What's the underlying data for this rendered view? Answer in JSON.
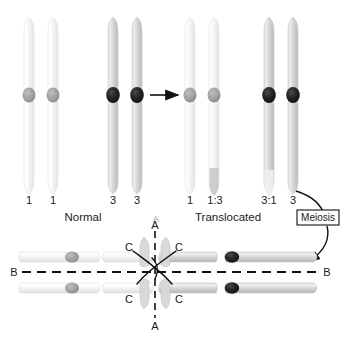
{
  "figure": {
    "panel_label": "A",
    "background_color": "#ffffff"
  },
  "top_row": {
    "groups": [
      {
        "name": "normal-pair-1",
        "group_label": "Normal",
        "chromosomes": [
          {
            "id": "chr-1-left",
            "number_label": "1",
            "body_color": "#f0f0f0",
            "centromere_color": "#9a9a9a",
            "tip_color": null
          },
          {
            "id": "chr-1-right",
            "number_label": "1",
            "body_color": "#f0f0f0",
            "centromere_color": "#9a9a9a",
            "tip_color": null
          }
        ]
      },
      {
        "name": "normal-pair-3",
        "group_label": "",
        "chromosomes": [
          {
            "id": "chr-3-left",
            "number_label": "3",
            "body_color": "#d2d2d2",
            "centromere_color": "#242424",
            "tip_color": null
          },
          {
            "id": "chr-3-right",
            "number_label": "3",
            "body_color": "#d2d2d2",
            "centromere_color": "#242424",
            "tip_color": null
          }
        ]
      },
      {
        "name": "translocated-pair-1",
        "group_label": "Translocated",
        "chromosomes": [
          {
            "id": "chr-t-1",
            "number_label": "1",
            "body_color": "#f0f0f0",
            "centromere_color": "#9a9a9a",
            "tip_color": null
          },
          {
            "id": "chr-t-1-3",
            "number_label": "1:3",
            "body_color": "#f0f0f0",
            "centromere_color": "#9a9a9a",
            "tip_color": "#c4c4c4"
          }
        ]
      },
      {
        "name": "translocated-pair-3",
        "group_label": "",
        "chromosomes": [
          {
            "id": "chr-t-3-1",
            "number_label": "3:1",
            "body_color": "#d2d2d2",
            "centromere_color": "#242424",
            "tip_color": "#eeeeee"
          },
          {
            "id": "chr-t-3",
            "number_label": "3",
            "body_color": "#d2d2d2",
            "centromere_color": "#242424",
            "tip_color": null
          }
        ]
      }
    ]
  },
  "transform_arrow": {
    "name": "translocation-arrow",
    "direction": "right"
  },
  "meiosis": {
    "box_label": "Meiosis",
    "arrow_name": "meiosis-curved-arrow"
  },
  "bottom_figure": {
    "name": "meiotic-quadrivalent-cross",
    "axis_labels": {
      "vertical_top": "A",
      "vertical_bottom": "A",
      "horizontal_left": "B",
      "horizontal_right": "B",
      "diagonal_upper_left": "C",
      "diagonal_upper_right": "C",
      "diagonal_lower_left": "C",
      "diagonal_lower_right": "C"
    },
    "left_arms": {
      "body_color": "#ececec",
      "centromere_color": "#9a9a9a"
    },
    "right_arms": {
      "body_color": "#cfcfcf",
      "centromere_color": "#262626"
    }
  }
}
